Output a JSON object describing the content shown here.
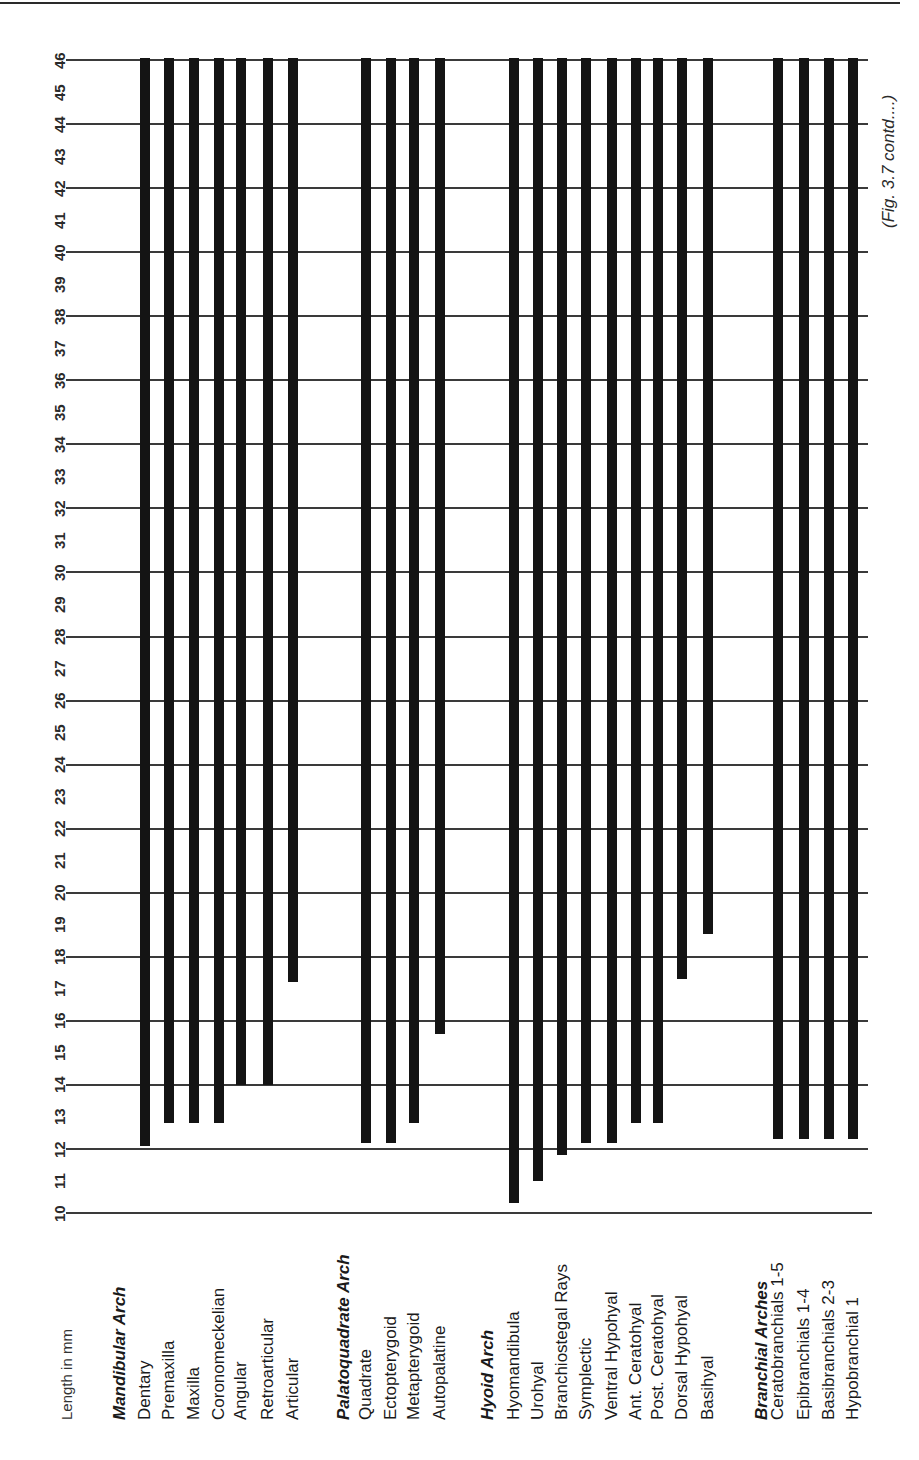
{
  "chart_data": {
    "type": "bar",
    "orientation": "vertical-range (bars hang from 46 mm down to onset length)",
    "title": "",
    "note": "(Fig. 3.7 contd....)",
    "xlabel": "",
    "ylabel": "Length in mm",
    "ylim": [
      10,
      46
    ],
    "yticks": [
      10,
      11,
      12,
      13,
      14,
      15,
      16,
      17,
      18,
      19,
      20,
      21,
      22,
      23,
      24,
      25,
      26,
      27,
      28,
      29,
      30,
      31,
      32,
      33,
      34,
      35,
      36,
      37,
      38,
      39,
      40,
      41,
      42,
      43,
      44,
      45,
      46
    ],
    "gridlines_at": [
      10,
      12,
      14,
      16,
      18,
      20,
      22,
      24,
      26,
      28,
      30,
      32,
      34,
      36,
      38,
      40,
      42,
      44,
      46
    ],
    "grid": true,
    "legend": null,
    "groups": [
      {
        "name": "Mandibular Arch",
        "items": [
          {
            "name": "Dentary",
            "start": 12.1,
            "end": 46
          },
          {
            "name": "Premaxilla",
            "start": 12.8,
            "end": 46
          },
          {
            "name": "Maxilla",
            "start": 12.8,
            "end": 46
          },
          {
            "name": "Coronomeckelian",
            "start": 12.8,
            "end": 46
          },
          {
            "name": "Angular",
            "start": 14.0,
            "end": 46
          },
          {
            "name": "Retroarticular",
            "start": 14.0,
            "end": 46
          },
          {
            "name": "Articular",
            "start": 17.2,
            "end": 46
          }
        ]
      },
      {
        "name": "Palatoquadrate Arch",
        "items": [
          {
            "name": "Quadrate",
            "start": 12.2,
            "end": 46
          },
          {
            "name": "Ectopterygoid",
            "start": 12.2,
            "end": 46
          },
          {
            "name": "Metapterygoid",
            "start": 12.8,
            "end": 46
          },
          {
            "name": "Autopalatine",
            "start": 15.6,
            "end": 46
          }
        ]
      },
      {
        "name": "Hyoid Arch",
        "items": [
          {
            "name": "Hyomandibula",
            "start": 10.3,
            "end": 46
          },
          {
            "name": "Urohyal",
            "start": 11.0,
            "end": 46
          },
          {
            "name": "Branchiostegal Rays",
            "start": 11.8,
            "end": 46
          },
          {
            "name": "Symplectic",
            "start": 12.2,
            "end": 46
          },
          {
            "name": "Ventral Hypohyal",
            "start": 12.2,
            "end": 46
          },
          {
            "name": "Ant. Ceratohyal",
            "start": 12.8,
            "end": 46
          },
          {
            "name": "Post. Ceratohyal",
            "start": 12.8,
            "end": 46
          },
          {
            "name": "Dorsal Hypohyal",
            "start": 17.3,
            "end": 46
          },
          {
            "name": "Basihyal",
            "start": 18.7,
            "end": 46
          }
        ]
      },
      {
        "name": "Branchial Arches",
        "items": [
          {
            "name": "Ceratobranchials 1-5",
            "start": 12.3,
            "end": 46
          },
          {
            "name": "Epibranchials 1-4",
            "start": 12.3,
            "end": 46
          },
          {
            "name": "Basibranchials 2-3",
            "start": 12.3,
            "end": 46
          },
          {
            "name": "Hypobranchial 1",
            "start": 12.3,
            "end": 46
          }
        ]
      }
    ]
  },
  "layout": {
    "y_top_px": 60,
    "px_per_mm": 32.03,
    "grid_left_px": 66,
    "grid_right_px": 868,
    "label_baseline_px": 1420,
    "tick_x_px": 52,
    "group_label_x": [
      120,
      344,
      488,
      762
    ],
    "axis_label_x": 58,
    "bar_x": [
      [
        145,
        169,
        194,
        219,
        241,
        268,
        293
      ],
      [
        366,
        391,
        414,
        440
      ],
      [
        514,
        538,
        562,
        586,
        612,
        636,
        658,
        682,
        708
      ],
      [
        778,
        804,
        829,
        853
      ]
    ],
    "bar_color": "#141414",
    "grid_color": "#3a3a3a"
  }
}
